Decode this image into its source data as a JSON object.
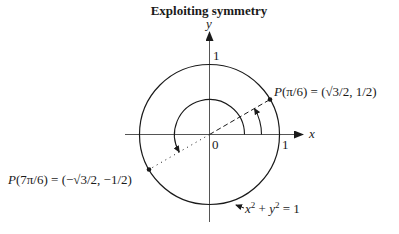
{
  "title": "Exploiting symmetry",
  "axes": {
    "x_label": "x",
    "y_label": "y",
    "origin_label": "0",
    "x_tick_label": "1",
    "y_tick_label": "1"
  },
  "points": [
    {
      "name": "P(π/6)",
      "label_func": "P",
      "label_arg": "(π/6)",
      "label_eq": " = (",
      "label_sqrt": "√3",
      "label_rest": "/2, 1/2)",
      "angle_deg": 30,
      "coords": "(√3/2, 1/2)"
    },
    {
      "name": "P(7π/6)",
      "label_func": "P",
      "label_arg": "(7π/6)",
      "label_eq": " = (−",
      "label_sqrt": "√3",
      "label_rest": "/2, −1/2)",
      "angle_deg": 210,
      "coords": "(−√3/2, −1/2)"
    }
  ],
  "circle_equation": {
    "text_x": "x",
    "sup1": "2",
    "plus": " + ",
    "text_y": "y",
    "sup2": "2",
    "rhs": " = 1"
  },
  "arcs": [
    {
      "name": "angle-pi-over-6",
      "from_deg": 0,
      "to_deg": 30
    },
    {
      "name": "angle-7pi-over-6",
      "from_deg": 0,
      "to_deg": 210
    }
  ],
  "colors": {
    "ink": "#1a1a1a",
    "axis": "#555555",
    "background": "#ffffff"
  }
}
